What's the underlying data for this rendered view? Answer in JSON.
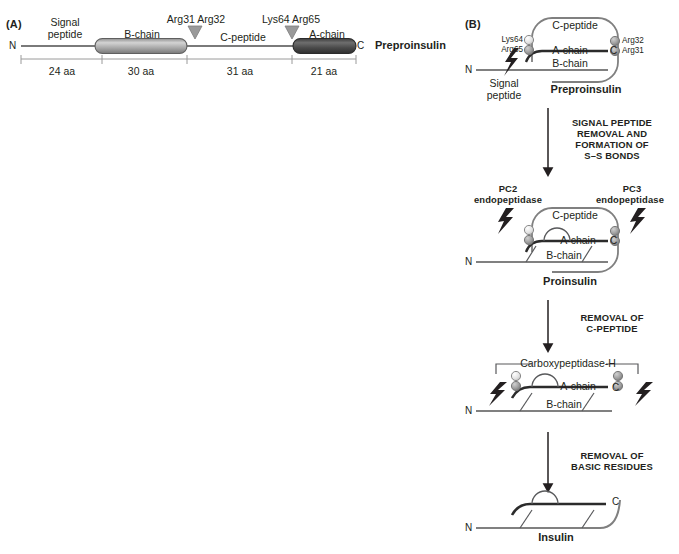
{
  "panel_a": {
    "label": "(A)",
    "molecule_name": "Preproinsulin",
    "n_terminus": "N",
    "c_terminus": "C",
    "segments": [
      {
        "name": "Signal peptide",
        "label_line1": "Signal",
        "label_line2": "peptide",
        "length": "24 aa",
        "style": "line"
      },
      {
        "name": "B-chain",
        "label_line1": "B-chain",
        "label_line2": "",
        "length": "30 aa",
        "style": "cylinder-light"
      },
      {
        "name": "C-peptide",
        "label_line1": "C-peptide",
        "label_line2": "",
        "length": "31 aa",
        "style": "line"
      },
      {
        "name": "A-chain",
        "label_line1": "A-chain",
        "label_line2": "",
        "length": "21 aa",
        "style": "cylinder-dark"
      }
    ],
    "cleavage_markers": [
      {
        "label": "Arg31 Arg32"
      },
      {
        "label": "Lys64 Arg65"
      }
    ],
    "colors": {
      "b_chain_fill": "#a8a8a8",
      "a_chain_fill": "#4d4d4d",
      "backbone": "#6e6e6e",
      "marker": "#8a8a8a"
    }
  },
  "panel_b": {
    "label": "(B)",
    "stages": [
      {
        "id": "preproinsulin",
        "name": "Preproinsulin",
        "chains": [
          "C-peptide",
          "A-chain",
          "B-chain"
        ],
        "termini": {
          "n": "N",
          "c": "C"
        },
        "residue_labels_left": [
          "Lys64",
          "Arg65"
        ],
        "residue_labels_right": [
          "Arg32",
          "Arg31"
        ],
        "extra_label_line1": "Signal",
        "extra_label_line2": "peptide"
      },
      {
        "id": "proinsulin",
        "name": "Proinsulin",
        "chains": [
          "C-peptide",
          "A-chain",
          "B-chain"
        ],
        "termini": {
          "n": "N",
          "c": "C"
        },
        "enzyme_left_line1": "PC2",
        "enzyme_left_line2": "endopeptidase",
        "enzyme_right_line1": "PC3",
        "enzyme_right_line2": "endopeptidase"
      },
      {
        "id": "des-peptide-intermediate",
        "name": "",
        "chains": [
          "A-chain",
          "B-chain"
        ],
        "termini": {
          "n": "N",
          "c": "C"
        },
        "bracket_label": "Carboxypeptidase-H"
      },
      {
        "id": "insulin",
        "name": "Insulin",
        "chains": [],
        "termini": {
          "n": "N",
          "c": "C"
        }
      }
    ],
    "transitions": [
      {
        "line1": "SIGNAL PEPTIDE",
        "line2": "REMOVAL AND",
        "line3": "FORMATION OF",
        "line4": "S–S BONDS"
      },
      {
        "line1": "REMOVAL OF",
        "line2": "C-PEPTIDE",
        "line3": "",
        "line4": ""
      },
      {
        "line1": "REMOVAL OF",
        "line2": "BASIC RESIDUES",
        "line3": "",
        "line4": ""
      }
    ],
    "colors": {
      "stroke": "#58595b",
      "chain_dark": "#2b2b2b",
      "bead_light": "#d9d9d9",
      "bead_dark": "#9a9a9a",
      "bolt": "#231f20"
    }
  }
}
